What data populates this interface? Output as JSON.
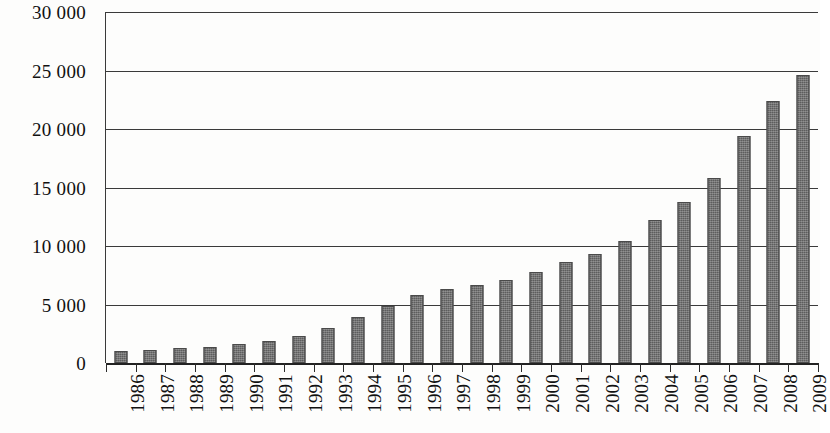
{
  "chart_data": {
    "type": "bar",
    "title": "",
    "subtitle": "",
    "xlabel": "",
    "ylabel": "",
    "categories": [
      "1986",
      "1987",
      "1988",
      "1989",
      "1990",
      "1991",
      "1992",
      "1993",
      "1994",
      "1995",
      "1996",
      "1997",
      "1998",
      "1999",
      "2000",
      "2001",
      "2002",
      "2003",
      "2004",
      "2005",
      "2006",
      "2007",
      "2008",
      "2009"
    ],
    "values": [
      1000,
      1100,
      1300,
      1400,
      1600,
      1900,
      2300,
      3000,
      3900,
      4900,
      5800,
      6300,
      6700,
      7100,
      7800,
      8600,
      9300,
      10400,
      12200,
      13800,
      15800,
      19400,
      22400,
      24600
    ],
    "series": [
      {
        "name": "",
        "values": [
          1000,
          1100,
          1300,
          1400,
          1600,
          1900,
          2300,
          3000,
          3900,
          4900,
          5800,
          6300,
          6700,
          7100,
          7800,
          8600,
          9300,
          10400,
          12200,
          13800,
          15800,
          19400,
          22400,
          24600
        ]
      }
    ],
    "ylim": [
      0,
      30000
    ],
    "y_ticks": [
      0,
      5000,
      10000,
      15000,
      20000,
      25000,
      30000
    ],
    "y_tick_labels": [
      "0",
      "5 000",
      "10 000",
      "15 000",
      "20 000",
      "25 000",
      "30 000"
    ],
    "grid": true,
    "grid_axis": "y",
    "legend": false,
    "legend_position": "none",
    "bar_color": "#5d5d5d",
    "grid_color": "#3a3a3a",
    "axis_color": "#222222",
    "background_color": "#ffffff",
    "x_tick_label_rotation": 90
  }
}
